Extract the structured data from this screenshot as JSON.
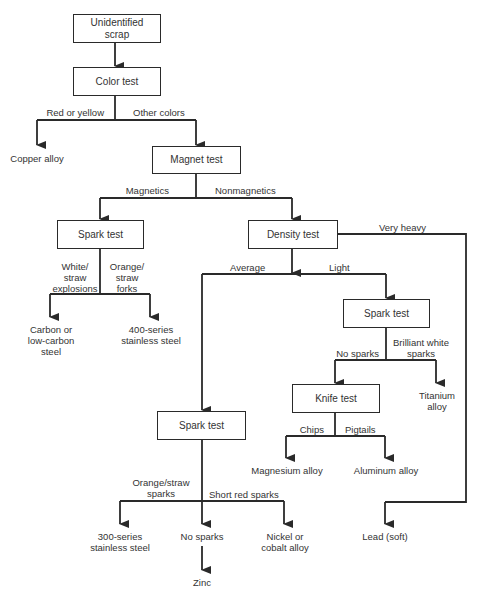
{
  "nodes": {
    "start": "Unidentified\nscrap",
    "color_test": "Color test",
    "copper": "Copper alloy",
    "magnet_test": "Magnet test",
    "spark_test_magnetic": "Spark test",
    "density_test": "Density test",
    "carbon_steel": "Carbon or\nlow-carbon\nsteel",
    "ss400": "400-series\nstainless steel",
    "spark_test_light": "Spark test",
    "knife_test": "Knife test",
    "titanium": "Titanium\nalloy",
    "magnesium": "Magnesium alloy",
    "aluminum": "Aluminum alloy",
    "spark_test_average": "Spark test",
    "ss300": "300-series\nstainless steel",
    "no_sparks": "No sparks",
    "nickel": "Nickel or\ncobalt alloy",
    "zinc": "Zinc",
    "lead": "Lead (soft)"
  },
  "edges": {
    "red_yellow": "Red or yellow",
    "other_colors": "Other colors",
    "magnetics": "Magnetics",
    "nonmagnetics": "Nonmagnetics",
    "white_straw": "White/\nstraw\nexplosions",
    "orange_straw_forks": "Orange/\nstraw\nforks",
    "very_heavy": "Very heavy",
    "average": "Average",
    "light": "Light",
    "no_sparks": "No sparks",
    "brilliant_white": "Brilliant white\nsparks",
    "chips": "Chips",
    "pigtails": "Pigtails",
    "orange_straw_sparks": "Orange/straw\nsparks",
    "short_red": "Short red sparks"
  }
}
